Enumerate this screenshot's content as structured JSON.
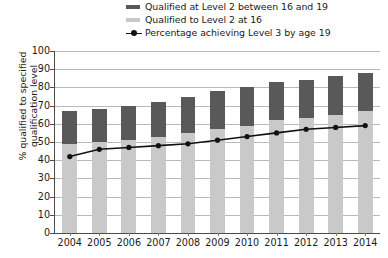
{
  "legend": {
    "items": [
      {
        "label": "Qualified at Level 2 between 16 and 19",
        "marker": "bar-swatch-dark",
        "color": "#595959"
      },
      {
        "label": "Qualified to Level 2 at 16",
        "marker": "bar-swatch-light",
        "color": "#c9c9c9"
      },
      {
        "label": "Percentage achieving Level 3 by age 19",
        "marker": "line-marker",
        "color": "#111111"
      }
    ]
  },
  "axes": {
    "y_title": "% qualified to specified qualification level",
    "y_ticks": [
      0,
      10,
      20,
      30,
      40,
      50,
      60,
      70,
      80,
      90,
      100
    ],
    "x_ticks": [
      "2004",
      "2005",
      "2006",
      "2007",
      "2008",
      "2009",
      "2010",
      "2011",
      "2012",
      "2013",
      "2014"
    ]
  },
  "chart_data": {
    "type": "bar",
    "title": "",
    "subtitle": "",
    "xlabel": "",
    "ylabel": "% qualified to specified qualification level",
    "ylim": [
      0,
      100
    ],
    "yticks": [
      0,
      10,
      20,
      30,
      40,
      50,
      60,
      70,
      80,
      90,
      100
    ],
    "grid": true,
    "stacked": true,
    "legend_position": "top",
    "categories": [
      "2004",
      "2005",
      "2006",
      "2007",
      "2008",
      "2009",
      "2010",
      "2011",
      "2012",
      "2013",
      "2014"
    ],
    "series": [
      {
        "name": "Qualified to Level 2 at 16",
        "type": "bar",
        "color": "#c9c9c9",
        "values": [
          49,
          50,
          51,
          53,
          55,
          57,
          59,
          62,
          63,
          65,
          67
        ]
      },
      {
        "name": "Qualified at Level 2 between 16 and 19",
        "type": "bar",
        "color": "#595959",
        "values": [
          18,
          18,
          19,
          19,
          20,
          21,
          21,
          21,
          21,
          21,
          21
        ]
      },
      {
        "name": "Percentage achieving Level 3 by age 19",
        "type": "line",
        "color": "#111111",
        "values": [
          42,
          46,
          47,
          48,
          49,
          51,
          53,
          55,
          57,
          58,
          59
        ]
      }
    ],
    "stack_totals": [
      67,
      68,
      70,
      72,
      75,
      78,
      80,
      83,
      84,
      86,
      88
    ]
  }
}
